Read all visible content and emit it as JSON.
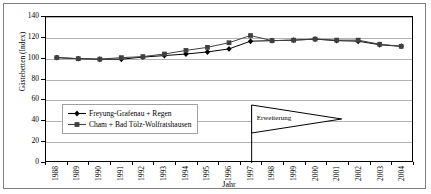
{
  "chart_data": {
    "type": "line",
    "title": "",
    "xlabel": "Jahr",
    "ylabel": "Gästebetten (Index)",
    "categories": [
      "1988",
      "1989",
      "1990",
      "1991",
      "1992",
      "1993",
      "1994",
      "1995",
      "1996",
      "1997",
      "1998",
      "1999",
      "2000",
      "2001",
      "2002",
      "2003",
      "2004"
    ],
    "x": [
      1988,
      1989,
      1990,
      1991,
      1992,
      1993,
      1994,
      1995,
      1996,
      1997,
      1998,
      1999,
      2000,
      2001,
      2002,
      2003,
      2004
    ],
    "ylim": [
      0,
      140
    ],
    "yticks": [
      0,
      20,
      40,
      60,
      80,
      100,
      120,
      140
    ],
    "grid": true,
    "legend_position": "inside-lower-left",
    "series": [
      {
        "name": "Freyung-Grafenau + Regen",
        "marker": "diamond",
        "color": "#000000",
        "values": [
          100.5,
          99.5,
          99.0,
          99.0,
          101.0,
          102.5,
          104.0,
          106.0,
          109.0,
          116.5,
          117.0,
          117.5,
          118.5,
          117.0,
          116.5,
          113.0,
          111.5
        ]
      },
      {
        "name": "Cham + Bad Tölz-Wolfratshausen",
        "marker": "square",
        "color": "#404040",
        "values": [
          100.5,
          99.5,
          99.0,
          100.5,
          101.5,
          104.0,
          107.5,
          110.5,
          115.0,
          122.0,
          117.0,
          117.5,
          118.5,
          117.5,
          117.5,
          113.5,
          111.5
        ]
      }
    ],
    "annotations": [
      {
        "label": "Erweiterung",
        "shape": "right-pointing-triangle-with-vertical-line",
        "x_anchor": "1997"
      }
    ]
  },
  "axes": {
    "y_ticks": [
      "140",
      "120",
      "100",
      "80",
      "60",
      "40",
      "20",
      "0"
    ],
    "x_ticks": [
      "1988",
      "1989",
      "1990",
      "1991",
      "1992",
      "1993",
      "1994",
      "1995",
      "1996",
      "1997",
      "1998",
      "1999",
      "2000",
      "2001",
      "2002",
      "2003",
      "2004"
    ],
    "y_title": "Gästebetten (Index)",
    "x_title": "Jahr"
  },
  "legend": {
    "items": [
      {
        "label": "Freyung-Grafenau + Regen",
        "marker": "diamond"
      },
      {
        "label": "Cham + Bad Tölz-Wolfratshausen",
        "marker": "square"
      }
    ]
  },
  "annotation": {
    "text": "Erweiterung"
  },
  "colors": {
    "series1": "#000000",
    "series2": "#404040",
    "grid": "#b3b3b3",
    "frame": "#000000",
    "outer_border": "#808080"
  }
}
